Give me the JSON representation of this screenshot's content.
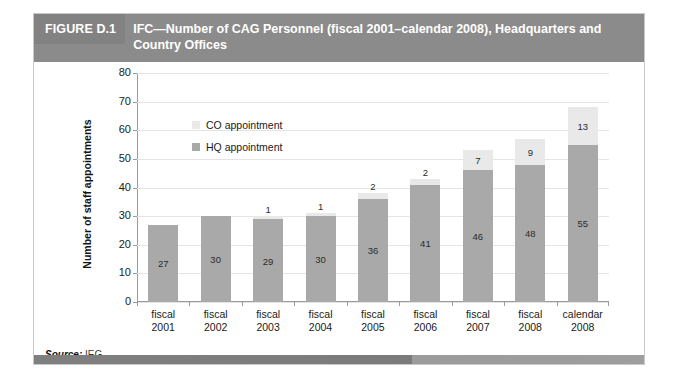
{
  "figure": {
    "number": "FIGURE D.1",
    "title": "IFC—Number of CAG Personnel (fiscal 2001–calendar 2008), Headquarters and Country Offices",
    "source_label": "Source:",
    "source_value": "IEG."
  },
  "chart_data": {
    "type": "bar",
    "subtype": "stacked",
    "title": "IFC—Number of CAG Personnel (fiscal 2001–calendar 2008), Headquarters and Country Offices",
    "xlabel": "",
    "ylabel": "Number of staff appointments",
    "ylim": [
      0,
      80
    ],
    "ytick_step": 10,
    "yticks": [
      0,
      10,
      20,
      30,
      40,
      50,
      60,
      70,
      80
    ],
    "grid": true,
    "legend_position": "upper-left-inside",
    "categories": [
      "fiscal 2001",
      "fiscal 2002",
      "fiscal 2003",
      "fiscal 2004",
      "fiscal 2005",
      "fiscal 2006",
      "fiscal 2007",
      "fiscal 2008",
      "calendar 2008"
    ],
    "category_lines": [
      [
        "fiscal",
        "2001"
      ],
      [
        "fiscal",
        "2002"
      ],
      [
        "fiscal",
        "2003"
      ],
      [
        "fiscal",
        "2004"
      ],
      [
        "fiscal",
        "2005"
      ],
      [
        "fiscal",
        "2006"
      ],
      [
        "fiscal",
        "2007"
      ],
      [
        "fiscal",
        "2008"
      ],
      [
        "calendar",
        "2008"
      ]
    ],
    "series": [
      {
        "name": "HQ appointment",
        "color": "#a9a9a9",
        "values": [
          27,
          30,
          29,
          30,
          36,
          41,
          46,
          48,
          55
        ],
        "labels": [
          "27",
          "30",
          "29",
          "30",
          "36",
          "41",
          "46",
          "48",
          "55"
        ]
      },
      {
        "name": "CO appointment",
        "color": "#e9e9e9",
        "values": [
          0,
          0,
          1,
          1,
          2,
          2,
          7,
          9,
          13
        ],
        "labels": [
          "",
          "",
          "1",
          "1",
          "2",
          "2",
          "7",
          "9",
          "13"
        ]
      }
    ],
    "totals": [
      27,
      30,
      30,
      31,
      38,
      43,
      53,
      57,
      68
    ]
  },
  "legend": {
    "items": [
      {
        "label": "CO appointment",
        "color": "#e9e9e9"
      },
      {
        "label": "HQ appointment",
        "color": "#a9a9a9"
      }
    ]
  },
  "colors": {
    "header_bar": "#8b8b8b",
    "header_number_block": "#828282",
    "hq_bar": "#a9a9a9",
    "co_bar": "#e9e9e9",
    "gridline": "#e4e4e4",
    "axis": "#9a9a9a",
    "frame_border": "#c9c9c9"
  }
}
